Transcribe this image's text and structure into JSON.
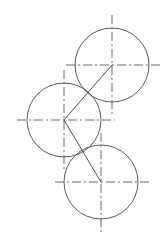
{
  "drawing": {
    "title": "Three tangent circles construction drawing",
    "canvas": {
      "width": 168,
      "height": 235,
      "background": "#ffffff"
    },
    "style": {
      "circle_stroke_color": "#585858",
      "center_line_color": "#6b6b6b",
      "link_line_color": "#4a4a4a",
      "circle_stroke_width": 1,
      "center_line_width": 1,
      "link_line_width": 1,
      "center_line_dash_pattern": "9 3 2 3"
    },
    "circles": [
      {
        "id": "top-circle",
        "label": "Top circle",
        "cx": 112,
        "cy": 65,
        "r": 37
      },
      {
        "id": "left-circle",
        "label": "Left circle",
        "cx": 64,
        "cy": 120,
        "r": 37
      },
      {
        "id": "bottom-circle",
        "label": "Bottom circle",
        "cx": 101,
        "cy": 182,
        "r": 37
      }
    ],
    "center_lines": [
      {
        "id": "top-circle-horizontal-centerline",
        "label": "Top circle horizontal center line",
        "orientation": "horizontal",
        "x1": 66,
        "y1": 65,
        "x2": 163,
        "y2": 65
      },
      {
        "id": "top-circle-vertical-centerline",
        "label": "Top circle vertical center line",
        "orientation": "vertical",
        "x1": 112,
        "y1": 15,
        "x2": 112,
        "y2": 116
      },
      {
        "id": "left-circle-horizontal-centerline",
        "label": "Left circle horizontal center line",
        "orientation": "horizontal",
        "x1": 17,
        "y1": 120,
        "x2": 115,
        "y2": 120
      },
      {
        "id": "left-circle-vertical-centerline",
        "label": "Left circle vertical center line",
        "orientation": "vertical",
        "x1": 64,
        "y1": 70,
        "x2": 64,
        "y2": 172
      },
      {
        "id": "bottom-circle-horizontal-centerline",
        "label": "Bottom circle horizontal center line",
        "orientation": "horizontal",
        "x1": 55,
        "y1": 182,
        "x2": 151,
        "y2": 182
      },
      {
        "id": "bottom-circle-vertical-centerline",
        "label": "Bottom circle vertical center line",
        "orientation": "vertical",
        "x1": 101,
        "y1": 133,
        "x2": 101,
        "y2": 232
      }
    ],
    "link_lines": [
      {
        "id": "link-left-to-top",
        "label": "Construction line from left circle centre to top circle centre",
        "x1": 64,
        "y1": 120,
        "x2": 112,
        "y2": 65
      },
      {
        "id": "link-left-to-bottom",
        "label": "Construction line from left circle centre to bottom circle centre",
        "x1": 64,
        "y1": 120,
        "x2": 101,
        "y2": 182
      }
    ]
  }
}
